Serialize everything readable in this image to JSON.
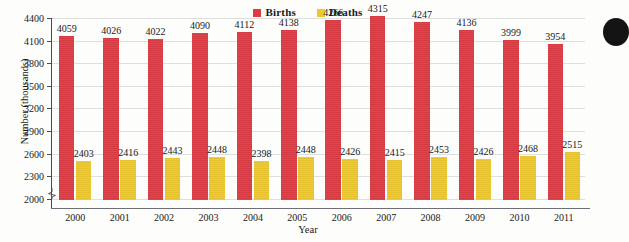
{
  "chart_data": {
    "type": "bar",
    "title": "",
    "xlabel": "Year",
    "ylabel": "Number (thousands)",
    "categories": [
      "2000",
      "2001",
      "2002",
      "2003",
      "2004",
      "2005",
      "2006",
      "2007",
      "2008",
      "2009",
      "2010",
      "2011"
    ],
    "series": [
      {
        "name": "Births",
        "color": "#dd3b43",
        "values": [
          4059,
          4026,
          4022,
          4090,
          4112,
          4138,
          4266,
          4315,
          4247,
          4136,
          3999,
          3954
        ]
      },
      {
        "name": "Deaths",
        "color": "#ecc72e",
        "values": [
          2403,
          2416,
          2443,
          2448,
          2398,
          2448,
          2426,
          2415,
          2453,
          2426,
          2468,
          2515
        ]
      }
    ],
    "yticks": [
      2000,
      2300,
      2600,
      2900,
      3200,
      3500,
      3800,
      4100,
      4400
    ],
    "ylim": [
      1880,
      4400
    ],
    "ytick_min": 2000,
    "ytick_max": 4400,
    "grid": true,
    "axis_break": true,
    "legend_position": "top-center",
    "data_labels": true
  },
  "legend": {
    "entries": [
      {
        "label": "Births",
        "color": "#dd3b43",
        "swatch_name": "births-swatch"
      },
      {
        "label": "Deaths",
        "color": "#ecc72e",
        "swatch_name": "deaths-swatch"
      }
    ]
  }
}
